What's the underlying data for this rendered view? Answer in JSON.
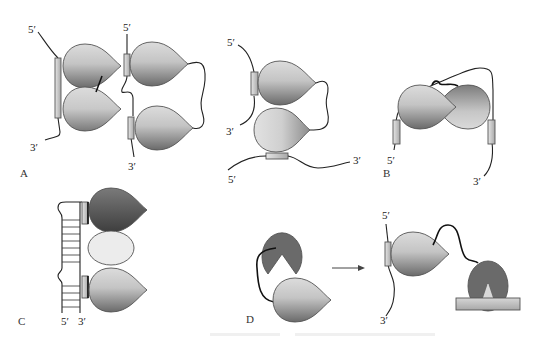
{
  "figure": {
    "panels": [
      {
        "id": "A",
        "label": "A"
      },
      {
        "id": "B",
        "label": "B"
      },
      {
        "id": "C",
        "label": "C"
      },
      {
        "id": "D",
        "label": "D"
      }
    ],
    "strand_labels": {
      "five_prime": "5′",
      "three_prime": "3′"
    },
    "panel_a": {
      "left": {
        "top": "5′",
        "bottom": "3′"
      },
      "middle": {
        "top": "5′",
        "bottom": "3′"
      },
      "right": {
        "top": "5′",
        "left_bottom": "3′",
        "bottom_left": "5′",
        "bottom_right": "3′"
      }
    },
    "panel_b": {
      "left": "5′",
      "right": "3′"
    },
    "panel_c": {
      "left": "5′",
      "right": "3′"
    },
    "panel_d": {
      "top": "5′",
      "bottom": "3′"
    },
    "caption": "",
    "colors": {
      "light_gray": "#d8d8d8",
      "mid_gray": "#9a9a9a",
      "dark_gray": "#5e5e5e",
      "pale": "#e8e8e8",
      "bar": "#c8c8c8"
    }
  }
}
